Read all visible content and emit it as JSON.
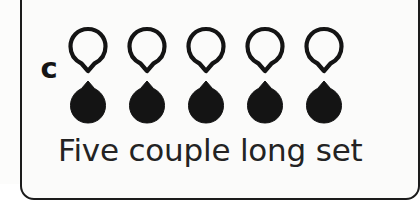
{
  "figure": {
    "panel_label": "c",
    "caption": "Five couple long set",
    "border_color": "#1b1b1b",
    "background_color": "#fbfbfa",
    "symbol_color": "#141414"
  },
  "formation": {
    "name": "five-couple-long-set",
    "couple_count": 5,
    "rows": [
      {
        "row_name": "ladies-row",
        "symbol": "hollow-pin-icon",
        "fill": "none",
        "point_direction": "down",
        "dancers": [
          {
            "position": 1,
            "label": "lady-1"
          },
          {
            "position": 2,
            "label": "lady-2"
          },
          {
            "position": 3,
            "label": "lady-3"
          },
          {
            "position": 4,
            "label": "lady-4"
          },
          {
            "position": 5,
            "label": "lady-5"
          }
        ]
      },
      {
        "row_name": "gents-row",
        "symbol": "filled-pin-icon",
        "fill": "solid",
        "point_direction": "up",
        "dancers": [
          {
            "position": 1,
            "label": "gent-1"
          },
          {
            "position": 2,
            "label": "gent-2"
          },
          {
            "position": 3,
            "label": "gent-3"
          },
          {
            "position": 4,
            "label": "gent-4"
          },
          {
            "position": 5,
            "label": "gent-5"
          }
        ]
      }
    ]
  }
}
